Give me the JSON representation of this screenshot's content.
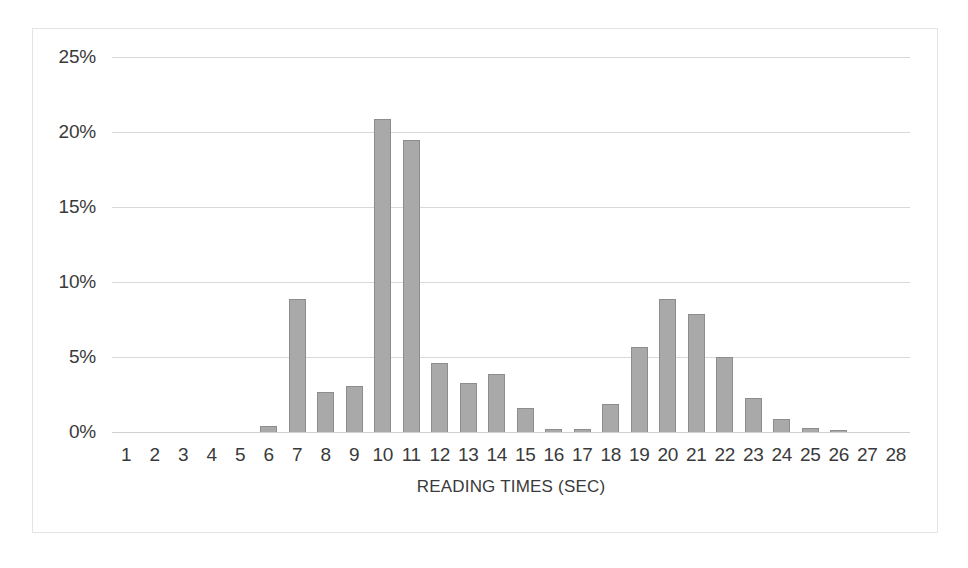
{
  "chart_data": {
    "type": "bar",
    "title": "",
    "xlabel": "READING TIMES (SEC)",
    "ylabel": "",
    "categories": [
      "1",
      "2",
      "3",
      "4",
      "5",
      "6",
      "7",
      "8",
      "9",
      "10",
      "11",
      "12",
      "13",
      "14",
      "15",
      "16",
      "17",
      "18",
      "19",
      "20",
      "21",
      "22",
      "23",
      "24",
      "25",
      "26",
      "27",
      "28"
    ],
    "values": [
      0,
      0,
      0,
      0,
      0,
      0.4,
      8.9,
      2.7,
      3.1,
      20.9,
      19.5,
      4.6,
      3.3,
      3.9,
      1.6,
      0.2,
      0.2,
      1.9,
      5.7,
      8.9,
      7.9,
      5.0,
      2.3,
      0.9,
      0.3,
      0.1,
      0,
      0
    ],
    "ylim": [
      0,
      25
    ],
    "ytick_values": [
      25,
      20,
      15,
      10,
      5,
      0
    ],
    "ytick_labels": [
      "25%",
      "20%",
      "15%",
      "10%",
      "5%",
      "0%"
    ],
    "value_unit": "%",
    "grid": true,
    "grid_axis": "y",
    "legend": false,
    "legend_position": "none",
    "series": [
      {
        "name": "Reading time distribution",
        "values": [
          0,
          0,
          0,
          0,
          0,
          0.4,
          8.9,
          2.7,
          3.1,
          20.9,
          19.5,
          4.6,
          3.3,
          3.9,
          1.6,
          0.2,
          0.2,
          1.9,
          5.7,
          8.9,
          7.9,
          5.0,
          2.3,
          0.9,
          0.3,
          0.1,
          0,
          0
        ]
      }
    ]
  },
  "style": {
    "bar_fill": "#a9a9a9",
    "bar_border": "#8d8d8d",
    "gridline_color": "#d9d9d9",
    "frame_color": "#e4e4e4",
    "text_color": "#3a3a3a",
    "background": "#ffffff"
  }
}
